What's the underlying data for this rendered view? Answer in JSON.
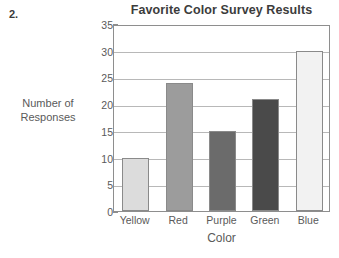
{
  "question_number": "2.",
  "chart_data": {
    "type": "bar",
    "title": "Favorite Color Survey Results",
    "xlabel": "Color",
    "ylabel": "Number of Responses",
    "ylabel_lines": [
      "Number of",
      "Responses"
    ],
    "categories": [
      "Yellow",
      "Red",
      "Purple",
      "Green",
      "Blue"
    ],
    "values": [
      10,
      24,
      15,
      21,
      30
    ],
    "ylim": [
      0,
      35
    ],
    "ytick_step": 5,
    "yticks": [
      0,
      5,
      10,
      15,
      20,
      25,
      30,
      35
    ],
    "ytick_labels": [
      "0",
      "5",
      "10",
      "15",
      "20",
      "25",
      "30",
      "35"
    ],
    "grid": "horizontal",
    "legend": "none",
    "bar_colors": [
      "#dcdcdc",
      "#9c9c9c",
      "#6b6b6b",
      "#4a4a4a",
      "#f2f2f2"
    ],
    "bar_border_color": "#8a8a8a",
    "gridline_color": "#b8b8b8",
    "axis_color": "#8e8e8e",
    "text_color": "#5a5a5a",
    "title_color": "#3c3c3c"
  }
}
